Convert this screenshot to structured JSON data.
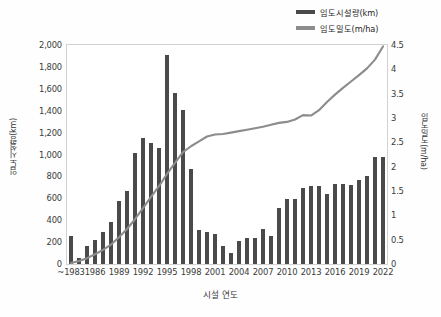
{
  "chart_data": {
    "type": "bar",
    "title": "",
    "xlabel": "시설 연도",
    "categories": [
      "~1983",
      "1984",
      "1985",
      "1986",
      "1987",
      "1988",
      "1989",
      "1990",
      "1991",
      "1992",
      "1993",
      "1994",
      "1995",
      "1996",
      "1997",
      "1998",
      "1999",
      "2000",
      "2001",
      "2002",
      "2003",
      "2004",
      "2005",
      "2006",
      "2007",
      "2008",
      "2009",
      "2010",
      "2011",
      "2012",
      "2013",
      "2014",
      "2015",
      "2016",
      "2017",
      "2018",
      "2019",
      "2020",
      "2021",
      "2022"
    ],
    "xtick_labels": [
      "~1983",
      "1986",
      "1989",
      "1992",
      "1995",
      "1998",
      "2001",
      "2004",
      "2007",
      "2010",
      "2013",
      "2016",
      "2019",
      "2022"
    ],
    "grid": false,
    "legend_position": "top-right",
    "series": [
      {
        "name": "임도시설량(km)",
        "type": "bar",
        "axis": "left",
        "color": "#4a4a4a",
        "unit": "km",
        "ylabel": "임도시설량(km)",
        "ylim": [
          0,
          2000
        ],
        "yticks": [
          "0",
          "200",
          "400",
          "600",
          "800",
          "1,000",
          "1,200",
          "1,400",
          "1,600",
          "1,800",
          "2,000"
        ],
        "ytick_values": [
          0,
          200,
          400,
          600,
          800,
          1000,
          1200,
          1400,
          1600,
          1800,
          2000
        ],
        "values": [
          255,
          55,
          160,
          220,
          290,
          380,
          580,
          670,
          1015,
          1150,
          1105,
          1060,
          1905,
          1560,
          1405,
          865,
          315,
          295,
          270,
          165,
          105,
          210,
          240,
          235,
          320,
          255,
          515,
          590,
          595,
          690,
          715,
          710,
          635,
          730,
          730,
          720,
          770,
          800,
          975,
          975
        ]
      },
      {
        "name": "임도밀도(m/ha)",
        "type": "line",
        "axis": "right",
        "color": "#8c8c8c",
        "unit": "m/ha",
        "ylabel": "임도밀도(m/ha)",
        "ylim": [
          0,
          4.5
        ],
        "yticks": [
          "0",
          "0.5",
          "1",
          "1.5",
          "2",
          "2.5",
          "3",
          "3.5",
          "4",
          "4.5"
        ],
        "ytick_values": [
          0,
          0.5,
          1,
          1.5,
          2,
          2.5,
          3,
          3.5,
          4,
          4.5
        ],
        "values": [
          0.02,
          0.06,
          0.12,
          0.2,
          0.29,
          0.4,
          0.55,
          0.72,
          0.92,
          1.15,
          1.38,
          1.6,
          1.85,
          2.08,
          2.3,
          2.42,
          2.52,
          2.62,
          2.66,
          2.67,
          2.7,
          2.73,
          2.76,
          2.79,
          2.82,
          2.86,
          2.9,
          2.92,
          2.97,
          3.06,
          3.05,
          3.16,
          3.33,
          3.48,
          3.62,
          3.75,
          3.88,
          4.02,
          4.2,
          4.47
        ]
      }
    ]
  },
  "legend": {
    "items": [
      {
        "label": "임도시설량(km)",
        "color": "#4a4a4a"
      },
      {
        "label": "임도밀도(m/ha)",
        "color": "#8c8c8c"
      }
    ]
  },
  "axes": {
    "left_title": "임도시설량(km)",
    "right_title": "임도밀도(m/ha)",
    "bottom_title": "시설 연도"
  }
}
